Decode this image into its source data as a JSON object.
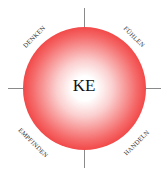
{
  "diagram": {
    "center_label": "KE",
    "labels": {
      "top_left": "DENKEN",
      "top_right": "FÜHLEN",
      "bottom_left": "EMPFINDEN",
      "bottom_right": "HANDELN"
    },
    "colors": {
      "circle_edge": "#e60f0f",
      "circle_center": "#ffffff",
      "axis_lines": "#8a8a8a"
    }
  }
}
